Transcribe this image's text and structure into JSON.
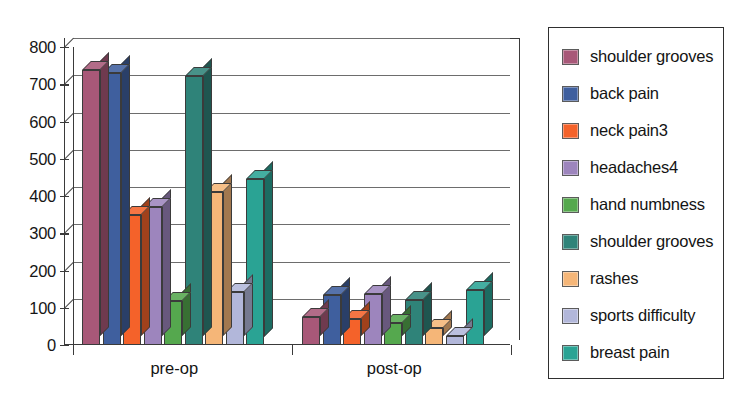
{
  "chart_data": {
    "type": "bar",
    "title": "",
    "subtitle": "",
    "xlabel": "",
    "ylabel": "",
    "categories": [
      "pre-op",
      "post-op"
    ],
    "ylim": [
      0,
      800
    ],
    "yticks": [
      0,
      100,
      200,
      300,
      400,
      500,
      600,
      700,
      800
    ],
    "ytick_labels": [
      "0",
      "100",
      "200",
      "300",
      "400",
      "500",
      "600",
      "700",
      "800"
    ],
    "grid": true,
    "legend_position": "right",
    "style": "3d-column",
    "series": [
      {
        "name": "shoulder grooves",
        "color": "#a85878",
        "values": [
          738,
          75
        ]
      },
      {
        "name": "back pain",
        "color": "#3f5f9e",
        "values": [
          730,
          135
        ]
      },
      {
        "name": "neck pain3",
        "color": "#f4622a",
        "values": [
          348,
          70
        ]
      },
      {
        "name": "headaches4",
        "color": "#9d85bd",
        "values": [
          370,
          137
        ]
      },
      {
        "name": "hand numbness",
        "color": "#55a84e",
        "values": [
          118,
          60
        ]
      },
      {
        "name": "shoulder grooves",
        "color": "#2f8379",
        "values": [
          722,
          122
        ]
      },
      {
        "name": "rashes",
        "color": "#f5b678",
        "values": [
          412,
          45
        ]
      },
      {
        "name": "sports difficulty",
        "color": "#b2b7da",
        "values": [
          143,
          25
        ]
      },
      {
        "name": "breast pain",
        "color": "#2aa394",
        "values": [
          447,
          148
        ]
      }
    ]
  },
  "legend": {
    "items": [
      {
        "label": "shoulder grooves",
        "color": "#a85878"
      },
      {
        "label": "back pain",
        "color": "#3f5f9e"
      },
      {
        "label": "neck pain3",
        "color": "#f4622a"
      },
      {
        "label": "headaches4",
        "color": "#9d85bd"
      },
      {
        "label": "hand numbness",
        "color": "#55a84e"
      },
      {
        "label": "shoulder grooves",
        "color": "#2f8379"
      },
      {
        "label": "rashes",
        "color": "#f5b678"
      },
      {
        "label": "sports difficulty",
        "color": "#b2b7da"
      },
      {
        "label": "breast pain",
        "color": "#2aa394"
      }
    ]
  },
  "colors": {
    "axis": "#3a3a3a",
    "gridline": "#6d6d6d",
    "background": "#ffffff",
    "text": "#141414"
  }
}
